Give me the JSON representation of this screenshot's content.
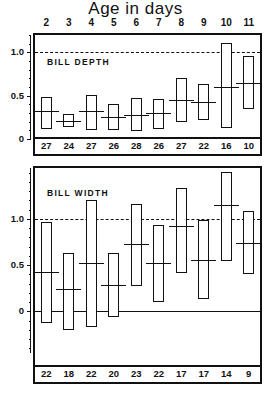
{
  "figure": {
    "title": "Age in days",
    "age_labels": [
      "2",
      "3",
      "4",
      "5",
      "6",
      "7",
      "8",
      "9",
      "10",
      "11"
    ]
  },
  "panels": {
    "top": {
      "label": "BILL DEPTH",
      "axis_labels": [
        "1.0",
        "0.5",
        "0"
      ]
    },
    "bottom": {
      "label": "BILL WIDTH",
      "axis_labels": [
        "1.0",
        "0.5",
        "0"
      ]
    }
  },
  "chart_data": [
    {
      "type": "bar",
      "title": "BILL DEPTH",
      "xlabel": "Age in days",
      "ylabel": "",
      "ylim": [
        0,
        1.2
      ],
      "grid": false,
      "reference_line": 1.0,
      "reference_line_style": "dashed",
      "categories": [
        "2",
        "3",
        "4",
        "5",
        "6",
        "7",
        "8",
        "9",
        "10",
        "11"
      ],
      "sample_sizes": [
        27,
        24,
        27,
        26,
        28,
        26,
        27,
        22,
        16,
        10
      ],
      "range_low": [
        0.12,
        0.14,
        0.1,
        0.1,
        0.09,
        0.11,
        0.2,
        0.22,
        0.13,
        0.35
      ],
      "range_high": [
        0.49,
        0.29,
        0.51,
        0.4,
        0.47,
        0.46,
        0.7,
        0.64,
        1.11,
        0.96
      ],
      "means": [
        0.32,
        0.21,
        0.32,
        0.25,
        0.28,
        0.3,
        0.45,
        0.43,
        0.6,
        0.65
      ]
    },
    {
      "type": "bar",
      "title": "BILL WIDTH",
      "xlabel": "Age in days",
      "ylabel": "",
      "ylim": [
        -0.45,
        1.55
      ],
      "grid": false,
      "reference_line": 1.0,
      "reference_line_style": "dashed",
      "zero_line": 0,
      "categories": [
        "2",
        "3",
        "4",
        "5",
        "6",
        "7",
        "8",
        "9",
        "10",
        "11"
      ],
      "sample_sizes": [
        22,
        18,
        22,
        20,
        23,
        22,
        17,
        17,
        14,
        9
      ],
      "range_low": [
        -0.13,
        -0.2,
        -0.17,
        -0.06,
        0.27,
        0.1,
        0.42,
        0.13,
        0.54,
        0.4
      ],
      "range_high": [
        0.97,
        0.63,
        1.2,
        0.63,
        1.16,
        0.93,
        1.33,
        0.99,
        1.51,
        1.09
      ],
      "means": [
        0.43,
        0.24,
        0.52,
        0.28,
        0.73,
        0.52,
        0.92,
        0.56,
        1.15,
        0.74
      ]
    }
  ]
}
